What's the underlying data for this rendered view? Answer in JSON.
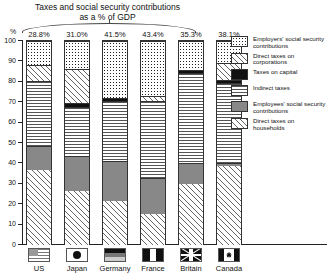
{
  "chart_data": {
    "type": "bar",
    "title": "Taxes and social security contributions as a % of GDP",
    "title_line1": "Taxes and social security contributions",
    "title_line2": "as a % of GDP",
    "xlabel": "",
    "ylabel": "%",
    "ylim": [
      0,
      100
    ],
    "grid": false,
    "stacked": true,
    "legend_position": "right",
    "categories": [
      "US",
      "Japan",
      "Germany",
      "France",
      "Britain",
      "Canada"
    ],
    "bar_labels": [
      "28.8%",
      "31.0%",
      "41.5%",
      "43.4%",
      "35.3%",
      "38.1%"
    ],
    "ytick_labels": [
      "0",
      "10",
      "20",
      "30",
      "40",
      "50",
      "60",
      "70",
      "80",
      "90",
      "100"
    ],
    "ytick_values": [
      0,
      10,
      20,
      30,
      40,
      50,
      60,
      70,
      80,
      90,
      100
    ],
    "series": [
      {
        "name": "Direct taxes on households",
        "pattern": "diagonal-hatch",
        "values": [
          37,
          26.5,
          21.5,
          15,
          30,
          38.5
        ]
      },
      {
        "name": "Employees' social security contributions",
        "pattern": "solid-gray",
        "values": [
          11.5,
          17,
          19.5,
          18,
          10,
          1.5
        ]
      },
      {
        "name": "Indirect taxes",
        "pattern": "horizontal-lines",
        "values": [
          32,
          24,
          29.5,
          37.5,
          44.5,
          39.5
        ]
      },
      {
        "name": "Taxes on capital",
        "pattern": "solid-black",
        "values": [
          0,
          2,
          1.5,
          0,
          1.5,
          1.5
        ]
      },
      {
        "name": "Direct taxes on corporations",
        "pattern": "light-diagonal-hatch",
        "values": [
          7.5,
          17,
          0,
          2.5,
          0,
          8
        ]
      },
      {
        "name": "Employers' social security contributions",
        "pattern": "dotted",
        "values": [
          12,
          13.5,
          28,
          27,
          14,
          11
        ]
      }
    ]
  },
  "legend": {
    "items": [
      {
        "label": "Employers' social security contributions",
        "pattern": "dotted"
      },
      {
        "label": "Direct taxes on corporations",
        "pattern": "light-diagonal-hatch"
      },
      {
        "label": "Taxes on capital",
        "pattern": "solid-black"
      },
      {
        "label": "Indirect taxes",
        "pattern": "horizontal-lines"
      },
      {
        "label": "Employees' social security contributions",
        "pattern": "solid-gray"
      },
      {
        "label": "Direct taxes on households",
        "pattern": "diagonal-hatch"
      }
    ]
  },
  "flags": [
    "us-flag",
    "japan-flag",
    "germany-flag",
    "france-flag",
    "britain-flag",
    "canada-flag"
  ]
}
